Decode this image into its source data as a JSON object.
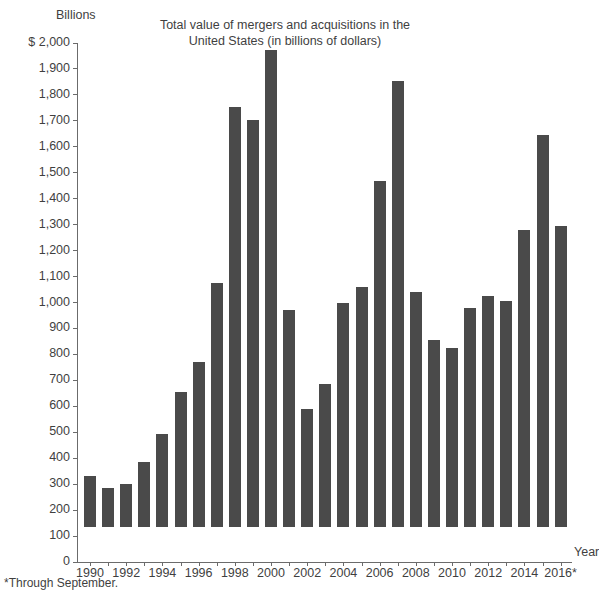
{
  "chart_data": {
    "type": "bar",
    "title": "Total value of mergers and acquisitions in the United States (in billions of dollars)",
    "title_line1": "Total value of mergers and acquisitions in the",
    "title_line2": "United States (in billions of dollars)",
    "unit_label": "Billions",
    "xlabel": "Year",
    "ylabel": "",
    "ylim": [
      0,
      2000
    ],
    "ytick_step": 100,
    "grid": false,
    "legend": null,
    "bar_color": "#4a4a4a",
    "axis_color": "#6b6b6b",
    "text_color": "#3f3f3f",
    "footnote": "*Through September.",
    "ytick_labels": [
      "$ 2,000",
      "1,900",
      "1,800",
      "1,700",
      "1,600",
      "1,500",
      "1,400",
      "1,300",
      "1,200",
      "1,100",
      "1,000",
      "900",
      "800",
      "700",
      "600",
      "500",
      "400",
      "300",
      "200",
      "100",
      "0"
    ],
    "ytick_values": [
      2000,
      1900,
      1800,
      1700,
      1600,
      1500,
      1400,
      1300,
      1200,
      1100,
      1000,
      900,
      800,
      700,
      600,
      500,
      400,
      300,
      200,
      100,
      0
    ],
    "categories": [
      "1990",
      "1991",
      "1992",
      "1993",
      "1994",
      "1995",
      "1996",
      "1997",
      "1998",
      "1999",
      "2000",
      "2001",
      "2002",
      "2003",
      "2004",
      "2005",
      "2006",
      "2007",
      "2008",
      "2009",
      "2010",
      "2011",
      "2012",
      "2013",
      "2014",
      "2015",
      "2016*"
    ],
    "xtick_labels": [
      "1990",
      "1992",
      "1994",
      "1996",
      "1998",
      "2000",
      "2002",
      "2004",
      "2006",
      "2008",
      "2010",
      "2012",
      "2014",
      "2016*"
    ],
    "values": [
      195,
      150,
      165,
      250,
      360,
      520,
      635,
      940,
      1620,
      1570,
      1840,
      835,
      455,
      550,
      865,
      925,
      1335,
      1720,
      905,
      720,
      690,
      845,
      890,
      870,
      1145,
      1510,
      1160
    ]
  }
}
